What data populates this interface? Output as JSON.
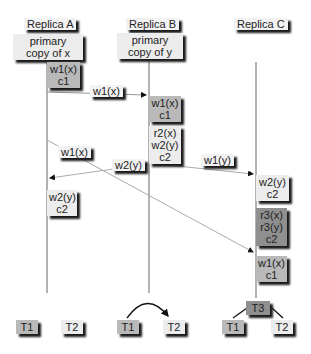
{
  "replicas": [
    {
      "name": "Replica A",
      "primary": [
        "primary",
        "copy of x"
      ]
    },
    {
      "name": "Replica B",
      "primary": [
        "primary",
        "copy of y"
      ]
    },
    {
      "name": "Replica C"
    }
  ],
  "operations": {
    "a_w1": [
      "w1(x)",
      "c1"
    ],
    "b_w1": [
      "w1(x)",
      "c1"
    ],
    "b_t2": [
      "r2(x)",
      "w2(y)",
      "c2"
    ],
    "a_w2": [
      "w2(y)",
      "c2"
    ],
    "c_w2": [
      "w2(y)",
      "c2"
    ],
    "c_t3": [
      "r3(x)",
      "r3(y)",
      "c2"
    ],
    "c_w1": [
      "w1(x)",
      "c1"
    ]
  },
  "messages": {
    "a_to_b": "w1(x)",
    "a_to_c": "w1(x)",
    "b_to_a": "w2(y)",
    "b_to_c": "w1(y)"
  },
  "serialization_graphs": {
    "a": [
      "T1",
      "T2"
    ],
    "b": [
      "T1",
      "T2"
    ],
    "c": [
      "T3",
      "T1",
      "T2"
    ]
  },
  "colors": {
    "light": "#ececec",
    "mid": "#b9b9b9",
    "dark": "#8f8f8f",
    "line": "#777777"
  }
}
